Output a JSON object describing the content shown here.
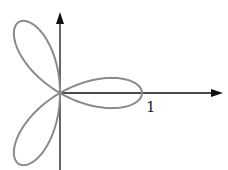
{
  "figure": {
    "type": "polar-rose",
    "equation": "r = cos(3θ)",
    "petals": 3,
    "tick_label": "1",
    "curve_color": "#8a8a8a",
    "axis_color": "#111111"
  }
}
